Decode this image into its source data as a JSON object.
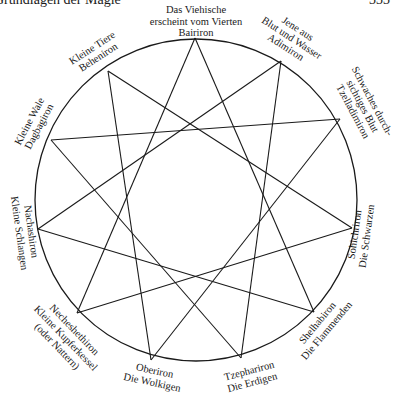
{
  "header": {
    "running_title": "Grundlagen der Magie",
    "page_number": "333"
  },
  "diagram": {
    "type": "eleven-pointed star inscribed in circle",
    "circle": {
      "cx": 196,
      "cy": 200,
      "r": 161
    },
    "star_step": 4,
    "points": [
      {
        "id": "bairiron",
        "name": "Bairiron",
        "lines": [
          "Das Viehische",
          "erscheint vom Vierten",
          "Bairiron"
        ],
        "x": 195,
        "y": 38
      },
      {
        "id": "adimiron",
        "name": "Adimiron",
        "lines": [
          "Jene aus",
          "Blut und Wasser",
          "Adimiron"
        ],
        "x": 281,
        "y": 61
      },
      {
        "id": "tzelladimiron",
        "name": "Tzelladimiron",
        "lines": [
          "Schwaches durch-",
          "sichtiges Blut",
          "Tzelladimiron"
        ],
        "x": 340,
        "y": 119
      },
      {
        "id": "sohichriron",
        "name": "Sohichriron",
        "lines": [
          "Sohichriron",
          "Die Schwarzen"
        ],
        "x": 352,
        "y": 228
      },
      {
        "id": "shelhabiron",
        "name": "Shelhabiron",
        "lines": [
          "Shelhabiron",
          "Die Flammenden"
        ],
        "x": 314,
        "y": 312
      },
      {
        "id": "tzephariron",
        "name": "Tzephariron",
        "lines": [
          "Tzephariron",
          "Die Erdigen"
        ],
        "x": 241,
        "y": 358
      },
      {
        "id": "oberiron",
        "name": "Oberiron",
        "lines": [
          "Oberiron",
          "Die Wolkigen"
        ],
        "x": 151,
        "y": 360
      },
      {
        "id": "necheshethiron",
        "name": "Necheshethiron",
        "lines": [
          "Necheshethiron",
          "Kleine Kupferkessel",
          "(oder Nattern)"
        ],
        "x": 77,
        "y": 313
      },
      {
        "id": "nachashiron",
        "name": "Nachashiron",
        "lines": [
          "Nachashiron",
          "Kleine Schlangen"
        ],
        "x": 38,
        "y": 229
      },
      {
        "id": "dagbagiron",
        "name": "Dagbagiron",
        "lines": [
          "Kleine Wale",
          "Dagbagiron"
        ],
        "x": 51,
        "y": 140
      },
      {
        "id": "beheniron",
        "name": "Beheniron",
        "lines": [
          "Kleine Tiere",
          "Beheniron"
        ],
        "x": 108,
        "y": 71
      }
    ]
  }
}
